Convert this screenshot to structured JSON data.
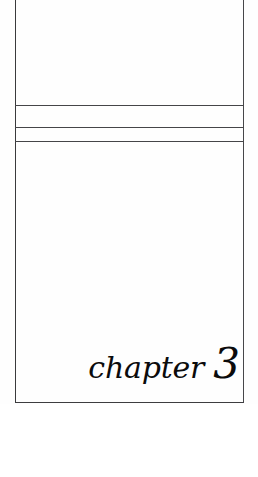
{
  "page": {
    "kind": "book-chapter-divider-scan",
    "background_color": "#ffffff",
    "ink_color": "#0b0b0c",
    "rule_color": "#454548"
  },
  "frame": {
    "label": "chapter-frame",
    "border_color": "#3a3a3c"
  },
  "rules": [
    {
      "name": "rule-upper",
      "label": ""
    },
    {
      "name": "rule-middle",
      "label": ""
    },
    {
      "name": "rule-lower",
      "label": ""
    }
  ],
  "regions": {
    "top_panel_text": "",
    "band_a_text": "",
    "band_b_text": "",
    "body_text": ""
  },
  "chapter": {
    "word": "chapter",
    "number": "3"
  },
  "footer": {
    "text": ""
  }
}
